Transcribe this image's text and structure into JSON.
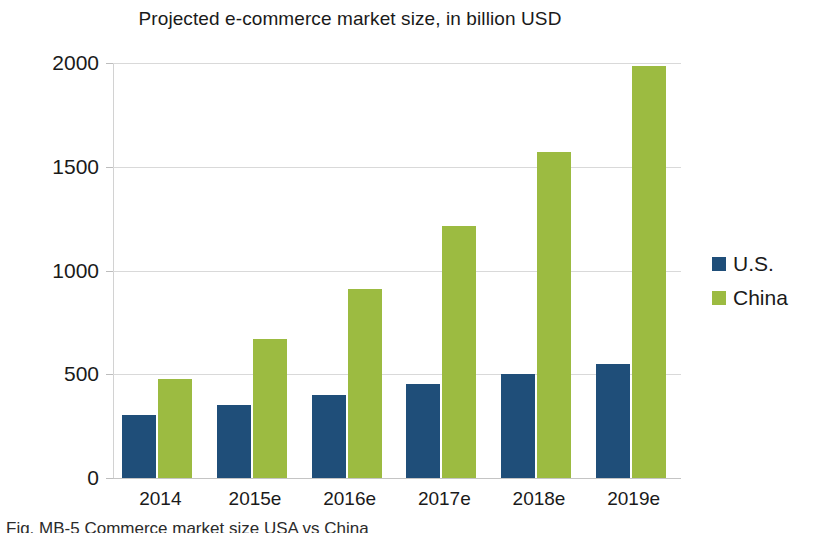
{
  "chart_data": {
    "type": "bar",
    "title": "Projected e-commerce market size, in billion USD",
    "xlabel": "",
    "ylabel": "",
    "categories": [
      "2014",
      "2015e",
      "2016e",
      "2017e",
      "2018e",
      "2019e"
    ],
    "series": [
      {
        "name": "U.S.",
        "color": "#1f4e79",
        "values": [
          305,
          352,
          400,
          452,
          500,
          550
        ]
      },
      {
        "name": "China",
        "color": "#9cbb41",
        "values": [
          478,
          672,
          910,
          1215,
          1570,
          1985
        ]
      }
    ],
    "ylim": [
      0,
      2000
    ],
    "yticks": [
      0,
      500,
      1000,
      1500,
      2000
    ],
    "ytick_labels": [
      "0",
      "500",
      "1000",
      "1500",
      "2000"
    ],
    "grid": true,
    "legend_position": "right"
  },
  "legend": {
    "entries": [
      {
        "label": "U.S.",
        "color": "#1f4e79"
      },
      {
        "label": "China",
        "color": "#9cbb41"
      }
    ]
  },
  "caption": {
    "text": "Fig. MB-5 Commerce market size USA vs China"
  },
  "colors": {
    "us": "#1f4e79",
    "china": "#9cbb41",
    "gridline": "#d9d9d9",
    "axis": "#c4c4c4",
    "text": "#1a1a1a",
    "background": "#ffffff"
  }
}
